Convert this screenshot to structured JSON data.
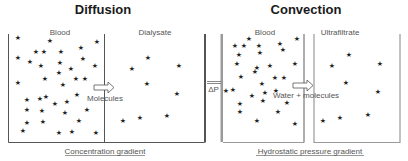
{
  "panels": [
    {
      "title": "Diffusion",
      "left_compartment": "Blood",
      "right_compartment": "Dialysate",
      "flow_label": "Molecules",
      "caption": "Concentration gradient"
    },
    {
      "title": "Convection",
      "left_compartment": "Blood",
      "right_compartment": "Ultrafiltrate",
      "flow_label": "Water + molecules",
      "caption": "Hydrostatic pressure gradient",
      "pressure_label": "ΔP"
    }
  ],
  "icons": {
    "solute": "star-icon",
    "flow": "arrow-right-icon"
  },
  "colors": {
    "lines": "#555555",
    "membrane_convection": "#9a9a9a",
    "text": "#555555",
    "title": "#1a1a1a"
  },
  "stars": {
    "diffusion_blood": [
      [
        18,
        37
      ],
      [
        50,
        40
      ],
      [
        97,
        41
      ],
      [
        81,
        47
      ],
      [
        36,
        51
      ],
      [
        44,
        51
      ],
      [
        61,
        51
      ],
      [
        83,
        58
      ],
      [
        18,
        57
      ],
      [
        30,
        61
      ],
      [
        41,
        65
      ],
      [
        60,
        62
      ],
      [
        71,
        68
      ],
      [
        95,
        65
      ],
      [
        59,
        72
      ],
      [
        45,
        78
      ],
      [
        76,
        78
      ],
      [
        85,
        78
      ],
      [
        18,
        82
      ],
      [
        63,
        84
      ],
      [
        27,
        99
      ],
      [
        40,
        98
      ],
      [
        46,
        96
      ],
      [
        55,
        103
      ],
      [
        67,
        101
      ],
      [
        77,
        94
      ],
      [
        27,
        109
      ],
      [
        42,
        110
      ],
      [
        65,
        112
      ],
      [
        87,
        109
      ],
      [
        27,
        122
      ],
      [
        43,
        121
      ],
      [
        79,
        120
      ],
      [
        23,
        130
      ],
      [
        59,
        132
      ],
      [
        72,
        131
      ],
      [
        96,
        132
      ]
    ],
    "diffusion_dialysate": [
      [
        148,
        57
      ],
      [
        132,
        68
      ],
      [
        179,
        65
      ],
      [
        147,
        83
      ],
      [
        177,
        93
      ],
      [
        123,
        120
      ],
      [
        140,
        117
      ],
      [
        167,
        115
      ]
    ],
    "convection_blood": [
      [
        249,
        38
      ],
      [
        297,
        38
      ],
      [
        235,
        45
      ],
      [
        244,
        45
      ],
      [
        259,
        45
      ],
      [
        280,
        43
      ],
      [
        239,
        54
      ],
      [
        260,
        52
      ],
      [
        283,
        49
      ],
      [
        237,
        63
      ],
      [
        257,
        67
      ],
      [
        270,
        65
      ],
      [
        295,
        63
      ],
      [
        255,
        71
      ],
      [
        241,
        76
      ],
      [
        275,
        77
      ],
      [
        284,
        77
      ],
      [
        262,
        83
      ],
      [
        226,
        90
      ],
      [
        233,
        89
      ],
      [
        252,
        95
      ],
      [
        265,
        92
      ],
      [
        276,
        90
      ],
      [
        240,
        103
      ],
      [
        263,
        100
      ],
      [
        287,
        102
      ],
      [
        240,
        111
      ],
      [
        278,
        111
      ],
      [
        257,
        120
      ],
      [
        295,
        123
      ]
    ],
    "convection_ultrafiltrate": [
      [
        349,
        54
      ],
      [
        332,
        65
      ],
      [
        380,
        63
      ],
      [
        346,
        82
      ],
      [
        378,
        91
      ],
      [
        323,
        120
      ],
      [
        340,
        117
      ],
      [
        368,
        114
      ]
    ]
  }
}
